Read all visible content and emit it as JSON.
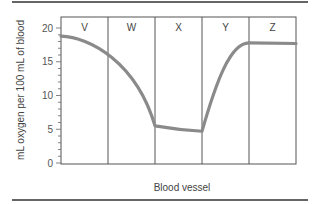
{
  "chart_data": {
    "type": "line",
    "title": "",
    "xlabel": "Blood vessel",
    "ylabel": "mL oxygen per 100 mL of blood",
    "ylim": [
      0,
      20
    ],
    "yticks": [
      0,
      5,
      10,
      15,
      20
    ],
    "ytick_labels": [
      "0",
      "5",
      "10",
      "15",
      "20"
    ],
    "regions": [
      "V",
      "W",
      "X",
      "Y",
      "Z"
    ],
    "grid": false,
    "legend": null,
    "series": [
      {
        "name": "Oxygen content",
        "color": "#8a8a8a",
        "points": [
          {
            "x": 0.0,
            "y": 18.8
          },
          {
            "x": 0.5,
            "y": 18.4
          },
          {
            "x": 1.0,
            "y": 16.8
          },
          {
            "x": 1.5,
            "y": 12.5
          },
          {
            "x": 2.0,
            "y": 5.5
          },
          {
            "x": 2.5,
            "y": 5.0
          },
          {
            "x": 3.0,
            "y": 4.7
          },
          {
            "x": 3.5,
            "y": 14.5
          },
          {
            "x": 4.0,
            "y": 17.8
          },
          {
            "x": 4.5,
            "y": 17.8
          },
          {
            "x": 5.0,
            "y": 17.7
          }
        ]
      }
    ],
    "summary": {
      "V": "starts ~19, gradually falls to ~17",
      "W": "drops steeply from ~17 to ~5.5",
      "X": "stays low, ~5.5 to ~4.7",
      "Y": "rises steeply from ~4.7 to ~18",
      "Z": "remains level at ~18"
    }
  }
}
